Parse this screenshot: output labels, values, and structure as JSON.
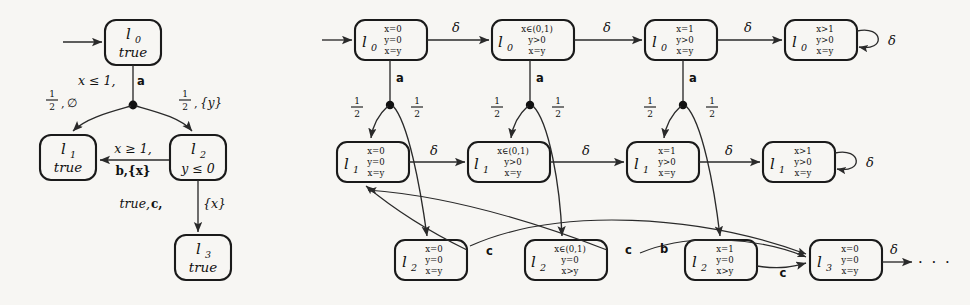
{
  "figure": {
    "type": "diagram",
    "ellipsis": "· · ·"
  },
  "symbols": {
    "delta": "δ",
    "half_num": "1",
    "half_den": "2",
    "emptyset": "∅",
    "leq": "≤",
    "geq": "≥",
    "in": "∈",
    "gt": ">",
    "eq": "="
  },
  "left_diagram": {
    "name": "pta",
    "nodes": [
      {
        "id": "l0",
        "label": "l",
        "sub": "0",
        "inv": "true",
        "x": 105,
        "y": 20,
        "w": 56,
        "h": 45
      },
      {
        "id": "l1",
        "label": "l",
        "sub": "1",
        "inv": "true",
        "x": 40,
        "y": 135,
        "w": 56,
        "h": 45
      },
      {
        "id": "l2",
        "label": "l",
        "sub": "2",
        "inv": "y ≤ 0",
        "x": 170,
        "y": 135,
        "w": 56,
        "h": 45
      },
      {
        "id": "l3",
        "label": "l",
        "sub": "3",
        "inv": "true",
        "x": 175,
        "y": 235,
        "w": 56,
        "h": 45
      }
    ],
    "edges": [
      {
        "id": "init",
        "kind": "initial-arrow"
      },
      {
        "id": "l0-branch",
        "guard": "x ≤ 1,",
        "action": "a"
      },
      {
        "id": "branch-left",
        "prob": "1/2",
        "reset": "∅"
      },
      {
        "id": "branch-right",
        "prob": "1/2",
        "reset": "{y}"
      },
      {
        "id": "l2-l1",
        "guard": "x ≥ 1,",
        "action_reset": "b,{x}"
      },
      {
        "id": "l2-l3",
        "guard": "true,",
        "action": "c,",
        "reset": "{x}"
      }
    ],
    "labels": {
      "guard_l0": "x ≤ 1,",
      "action_a": "a",
      "reset_empty": "∅",
      "reset_y": "{y}",
      "guard_l2l1": "x ≥ 1,",
      "action_b": "b,{x}",
      "guard_true": "true,",
      "action_c": "c,",
      "reset_x": "{x}"
    }
  },
  "right_diagram": {
    "name": "region-graph",
    "rows": [
      {
        "row": "l0",
        "nodes": [
          {
            "loc": "l",
            "sub": "0",
            "c1": "x=0",
            "c2": "y=0",
            "c3": "x=y",
            "x": 355,
            "y": 20,
            "w": 72,
            "h": 40
          },
          {
            "loc": "l",
            "sub": "0",
            "c1": "x∈(0,1)",
            "c2": "y>0",
            "c3": "x=y",
            "x": 492,
            "y": 20,
            "w": 82,
            "h": 40
          },
          {
            "loc": "l",
            "sub": "0",
            "c1": "x=1",
            "c2": "y>0",
            "c3": "x=y",
            "x": 645,
            "y": 20,
            "w": 72,
            "h": 40
          },
          {
            "loc": "l",
            "sub": "0",
            "c1": "x>1",
            "c2": "y>0",
            "c3": "x=y",
            "x": 785,
            "y": 20,
            "w": 72,
            "h": 40
          }
        ],
        "selfloop": "δ"
      },
      {
        "row": "l1",
        "nodes": [
          {
            "loc": "l",
            "sub": "1",
            "c1": "x=0",
            "c2": "y=0",
            "c3": "x=y",
            "x": 337,
            "y": 142,
            "w": 72,
            "h": 40
          },
          {
            "loc": "l",
            "sub": "1",
            "c1": "x∈(0,1)",
            "c2": "y>0",
            "c3": "x=y",
            "x": 468,
            "y": 142,
            "w": 82,
            "h": 40
          },
          {
            "loc": "l",
            "sub": "1",
            "c1": "x=1",
            "c2": "y>0",
            "c3": "x=y",
            "x": 627,
            "y": 142,
            "w": 72,
            "h": 40
          },
          {
            "loc": "l",
            "sub": "1",
            "c1": "x>1",
            "c2": "y>0",
            "c3": "x=y",
            "x": 763,
            "y": 142,
            "w": 72,
            "h": 40
          }
        ],
        "selfloop": "δ"
      },
      {
        "row": "l2",
        "nodes": [
          {
            "loc": "l",
            "sub": "2",
            "c1": "x=0",
            "c2": "y=0",
            "c3": "x=y",
            "x": 395,
            "y": 240,
            "w": 72,
            "h": 40
          },
          {
            "loc": "l",
            "sub": "2",
            "c1": "x∈(0,1)",
            "c2": "y=0",
            "c3": "x>y",
            "x": 525,
            "y": 240,
            "w": 82,
            "h": 40
          },
          {
            "loc": "l",
            "sub": "2",
            "c1": "x=1",
            "c2": "y=0",
            "c3": "x>y",
            "x": 685,
            "y": 240,
            "w": 72,
            "h": 40
          },
          {
            "loc": "l",
            "sub": "3",
            "c1": "x=0",
            "c2": "y=0",
            "c3": "x=y",
            "x": 810,
            "y": 240,
            "w": 72,
            "h": 40
          }
        ]
      }
    ],
    "edge_labels": {
      "delta": "δ",
      "action_a": "a",
      "action_b": "b",
      "action_c": "c",
      "prob_num": "1",
      "prob_den": "2",
      "trailing": "δ"
    }
  }
}
